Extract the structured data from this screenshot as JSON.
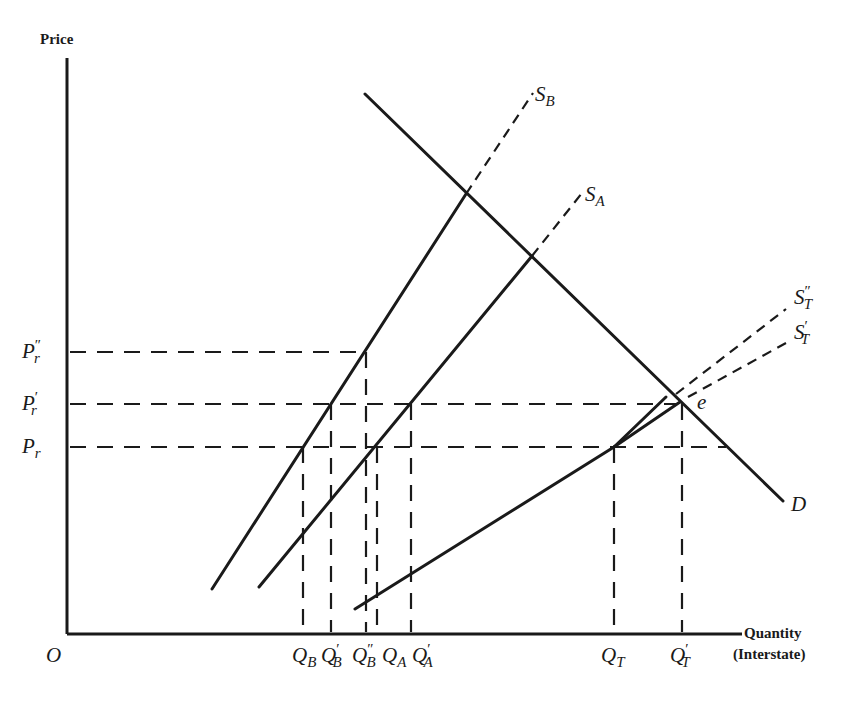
{
  "diagram": {
    "y_axis_title": "Price",
    "x_axis_title_line1": "Quantity",
    "x_axis_title_line2": "(Interstate)",
    "origin_label": "O",
    "price_levels": [
      {
        "id": "pr_double",
        "base": "P",
        "sub": "r",
        "prime": "″"
      },
      {
        "id": "pr_single",
        "base": "P",
        "sub": "r",
        "prime": "′"
      },
      {
        "id": "pr",
        "base": "P",
        "sub": "r",
        "prime": ""
      }
    ],
    "quantity_levels": [
      {
        "id": "qb",
        "base": "Q",
        "sub": "B",
        "prime": ""
      },
      {
        "id": "qb1",
        "base": "Q",
        "sub": "B",
        "prime": "′"
      },
      {
        "id": "qb2",
        "base": "Q",
        "sub": "B",
        "prime": "″"
      },
      {
        "id": "qa",
        "base": "Q",
        "sub": "A",
        "prime": ""
      },
      {
        "id": "qa1",
        "base": "Q",
        "sub": "A",
        "prime": "′"
      },
      {
        "id": "qt",
        "base": "Q",
        "sub": "T",
        "prime": ""
      },
      {
        "id": "qt1",
        "base": "Q",
        "sub": "T",
        "prime": "′"
      }
    ],
    "curves": [
      {
        "id": "sb",
        "base": "S",
        "sub": "B",
        "prime": "",
        "kind": "supply"
      },
      {
        "id": "sa",
        "base": "S",
        "sub": "A",
        "prime": "",
        "kind": "supply"
      },
      {
        "id": "st2",
        "base": "S",
        "sub": "T",
        "prime": "″",
        "kind": "supply"
      },
      {
        "id": "st1",
        "base": "S",
        "sub": "T",
        "prime": "′",
        "kind": "supply"
      },
      {
        "id": "d",
        "base": "D",
        "sub": "",
        "prime": "",
        "kind": "demand"
      }
    ],
    "equilibrium_label": "e"
  }
}
